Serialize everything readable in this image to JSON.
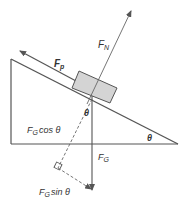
{
  "diagram": {
    "type": "inclined-plane-free-body",
    "labels": {
      "normal_force": {
        "main": "F",
        "sub": "N"
      },
      "pulling_force": {
        "main": "F",
        "sub": "p"
      },
      "gravity": {
        "main": "F",
        "sub": "G"
      },
      "gravity_perp": {
        "main": "F",
        "sub": "G",
        "suffix": "cos θ"
      },
      "gravity_parallel": {
        "main": "F",
        "sub": "G",
        "suffix": "sin θ"
      },
      "angle_incline": "θ",
      "angle_block": "θ"
    },
    "colors": {
      "line": "#555555",
      "block_fill": "#d4d4d4",
      "text": "#333333"
    }
  }
}
